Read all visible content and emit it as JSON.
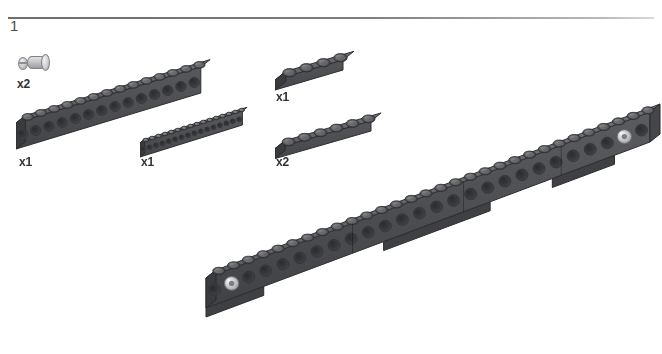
{
  "page": {
    "background_color": "#ffffff",
    "width": 662,
    "height": 354,
    "type": "lego-building-instruction-step"
  },
  "step": {
    "number": "1",
    "rule_color": "#7d7d7d"
  },
  "colors": {
    "brick_dark_gray": "#4f5053",
    "brick_top_gray": "#5e6064",
    "stud_gray": "#5a5c60",
    "pin_light_gray": "#c3c5c7",
    "label_text": "#333333",
    "step_number_text": "#4d4d4d"
  },
  "parts_callout": [
    {
      "id": "technic-pin",
      "name": "technic-pin-with-friction",
      "quantity_label": "x2",
      "color": "light-gray",
      "studs": 0
    },
    {
      "id": "technic-brick-1x14",
      "name": "technic-brick-with-holes",
      "quantity_label": "x1",
      "color": "dark-gray",
      "studs": 14
    },
    {
      "id": "technic-beam-1x16",
      "name": "technic-beam-thin-with-holes",
      "quantity_label": "x1",
      "color": "dark-gray",
      "studs": 16
    },
    {
      "id": "plate-1x4",
      "name": "plate-1x4",
      "quantity_label": "x1",
      "color": "dark-gray",
      "studs": 4
    },
    {
      "id": "plate-1x6",
      "name": "plate-1x6",
      "quantity_label": "x2",
      "color": "dark-gray",
      "studs": 6
    }
  ],
  "assembly": {
    "name": "long-technic-beam-assembly",
    "description": "Long dark gray Technic beam built from stacked bricks and plates with a light gray pin at each end",
    "pins": [
      {
        "position": "left-end",
        "color": "light-gray"
      },
      {
        "position": "right-end",
        "color": "light-gray"
      }
    ],
    "top_studs": 30
  }
}
